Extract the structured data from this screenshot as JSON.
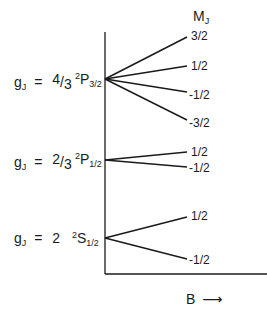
{
  "diagram": {
    "title_mj": "M",
    "title_mj_sub": "J",
    "axis_label": "B",
    "axis_arrow": "⟶",
    "line_color": "#1a1a1a",
    "levels": [
      {
        "name": "2P3/2",
        "g_label": "g",
        "g_sub": "J",
        "g_equals": "=",
        "g_num": "4",
        "g_den": "3",
        "term_sup": "2",
        "term_letter": "P",
        "term_sub": "3/2",
        "mj": [
          "3/2",
          "1/2",
          "-1/2",
          "-3/2"
        ]
      },
      {
        "name": "2P1/2",
        "g_label": "g",
        "g_sub": "J",
        "g_equals": "=",
        "g_num": "2",
        "g_den": "3",
        "term_sup": "2",
        "term_letter": "P",
        "term_sub": "1/2",
        "mj": [
          "1/2",
          "-1/2"
        ]
      },
      {
        "name": "2S1/2",
        "g_label": "g",
        "g_sub": "J",
        "g_equals": "=",
        "g_value": "2",
        "term_sup": "2",
        "term_letter": "S",
        "term_sub": "1/2",
        "mj": [
          "1/2",
          "-1/2"
        ]
      }
    ]
  }
}
